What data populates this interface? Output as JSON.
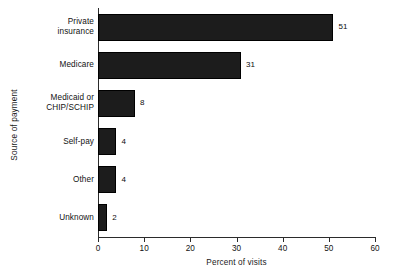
{
  "chart_data": {
    "type": "bar",
    "orientation": "horizontal",
    "title": "",
    "xlabel": "Percent of visits",
    "ylabel": "Source of payment",
    "categories": [
      "Private insurance",
      "Medicare",
      "Medicaid or CHIP/SCHIP",
      "Self-pay",
      "Other",
      "Unknown"
    ],
    "category_lines": [
      [
        "Private",
        "insurance"
      ],
      [
        "Medicare"
      ],
      [
        "Medicaid or",
        "CHIP/SCHIP"
      ],
      [
        "Self-pay"
      ],
      [
        "Other"
      ],
      [
        "Unknown"
      ]
    ],
    "values": [
      51,
      31,
      8,
      4,
      4,
      2
    ],
    "value_labels": [
      "51",
      "31",
      "8",
      "4",
      "4",
      "2"
    ],
    "xlim": [
      0,
      60
    ],
    "xticks": [
      0,
      10,
      20,
      30,
      40,
      50,
      60
    ],
    "xtick_labels": [
      "0",
      "10",
      "20",
      "30",
      "40",
      "50",
      "60"
    ],
    "grid": false,
    "legend": false,
    "bar_color": "#1c1c1c",
    "axis_color": "#2b2b2b",
    "background": "#ffffff"
  }
}
